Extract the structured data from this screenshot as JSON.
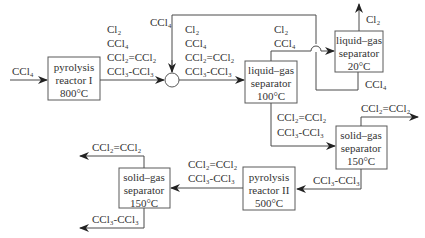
{
  "input": {
    "feed": "CCl₄"
  },
  "units": {
    "reactor1": [
      "pyrolysis",
      "reactor I",
      "800°C"
    ],
    "lg100": [
      "liquid–gas",
      "separator",
      "100°C"
    ],
    "lg20": [
      "liquid–gas",
      "separator",
      "20°C"
    ],
    "sg_right": [
      "solid–gas",
      "separator",
      "150°C"
    ],
    "reactor2": [
      "pyrolysis",
      "reactor II",
      "500°C"
    ],
    "sg_left": [
      "solid–gas",
      "separator",
      "150°C"
    ]
  },
  "streams": {
    "reactor1_out": [
      "Cl₂",
      "CCl₄",
      "CCl₂=CCl₂",
      "CCl₃-CCl₃"
    ],
    "recycle": "CCl₄",
    "mixer_out": [
      "Cl₂",
      "CCl₄",
      "CCl₂=CCl₂",
      "CCl₃-CCl₃"
    ],
    "lg100_top": [
      "Cl₂",
      "CCl₄"
    ],
    "lg20_top": "Cl₂",
    "lg20_bottom": "CCl₄",
    "lg100_bottom": [
      "CCl₂=CCl₂",
      "CCl₃-CCl₃"
    ],
    "sg_right_top": "CCl₂=CCl₂",
    "sg_right_bottom": "CCl₃-CCl₃",
    "reactor2_out": [
      "CCl₂=CCl₂",
      "CCl₃-CCl₃"
    ],
    "sg_left_top": "CCl₂=CCl₂",
    "sg_left_bottom": "CCl₃-CCl₃"
  }
}
